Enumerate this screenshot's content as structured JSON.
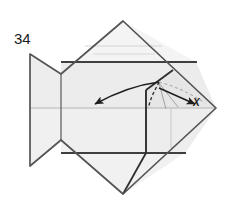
{
  "figure": {
    "kind": "origami-folding-diagram",
    "step_number": "34",
    "point_labels": [
      {
        "id": "x",
        "text": "X",
        "x": 196,
        "y": 105
      }
    ],
    "colors": {
      "paper_front": "#f2f2f2",
      "paper_shade": "#e8e8e8",
      "paper_highlight": "#fafafa",
      "edge_dark": "#3a3a3a",
      "crease_light": "#b5b5b5",
      "crease_mid": "#8a8a8a",
      "guide_gray": "#b0b0b0",
      "arrow_dark": "#1f1f1f",
      "background": "#ffffff",
      "text": "#1a1a1a"
    },
    "outline": {
      "name": "fish-body-diamond",
      "points": "123,21 216,108 123,194 61,140 30,166 30,54 61,74"
    },
    "shapes": [
      {
        "name": "upper-triangle-panel",
        "points": "123,21 196,62 61,62 61,74",
        "fill": "#f4f4f4"
      },
      {
        "name": "upper-mid-band",
        "points": "61,62 196,62 216,108 61,108",
        "fill": "#ececec"
      },
      {
        "name": "lower-mid-band",
        "points": "61,108 216,108 185,153 61,153",
        "fill": "#efefef"
      },
      {
        "name": "lower-triangle-panel",
        "points": "61,153 185,153 123,194 61,140",
        "fill": "#f1f1f1"
      },
      {
        "name": "tail-upper-panel",
        "points": "30,54 61,74 61,108 30,108",
        "fill": "#ededed"
      },
      {
        "name": "tail-lower-panel",
        "points": "30,108 61,108 61,140 30,166",
        "fill": "#f0f0f0"
      },
      {
        "name": "head-flap-panel",
        "points": "146,90 172,71 216,108 146,108",
        "fill": "#e6e6e6"
      },
      {
        "name": "head-lower-panel",
        "points": "146,108 216,108 185,153 146,153",
        "fill": "#ededed"
      }
    ],
    "creases": [
      {
        "name": "crease-center-horizontal",
        "x1": 30,
        "y1": 108,
        "x2": 216,
        "y2": 108,
        "style": "light"
      },
      {
        "name": "crease-upper-horizontal",
        "x1": 61,
        "y1": 62,
        "x2": 196,
        "y2": 62,
        "style": "dark"
      },
      {
        "name": "crease-lower-horizontal",
        "x1": 61,
        "y1": 153,
        "x2": 185,
        "y2": 153,
        "style": "dark"
      },
      {
        "name": "crease-upper-inner-1",
        "x1": 85,
        "y1": 46,
        "x2": 162,
        "y2": 46,
        "style": "faint"
      },
      {
        "name": "crease-upper-inner-2",
        "x1": 93,
        "y1": 54,
        "x2": 155,
        "y2": 54,
        "style": "faint"
      },
      {
        "name": "crease-tail-joint",
        "x1": 61,
        "y1": 74,
        "x2": 61,
        "y2": 140,
        "style": "mid"
      },
      {
        "name": "crease-head-vertical",
        "x1": 146,
        "y1": 90,
        "x2": 146,
        "y2": 153,
        "style": "dark"
      },
      {
        "name": "crease-head-inner-vertical",
        "x1": 171,
        "y1": 108,
        "x2": 171,
        "y2": 148,
        "style": "faint"
      },
      {
        "name": "crease-head-diagonal-upper",
        "x1": 146,
        "y1": 90,
        "x2": 172,
        "y2": 71,
        "style": "dark"
      },
      {
        "name": "crease-head-diagonal-lower",
        "x1": 146,
        "y1": 153,
        "x2": 185,
        "y2": 153,
        "style": "dark"
      },
      {
        "name": "crease-head-bottom-slant",
        "x1": 146,
        "y1": 153,
        "x2": 123,
        "y2": 194,
        "style": "dark"
      }
    ],
    "fold_lines": [
      {
        "name": "mountain-fold-dashed",
        "path": "M 159,82 L 152,96 L 148,108",
        "style": "dashed-dark"
      }
    ],
    "guides": [
      {
        "name": "guide-arc-gray-dashed",
        "path": "M 159,82 Q 182,88 205,103",
        "style": "dashed-gray"
      },
      {
        "name": "guide-line-thin-1",
        "path": "M 159,83 L 166,109",
        "style": "thin-gray"
      },
      {
        "name": "guide-line-thin-2",
        "path": "M 159,83 L 178,107",
        "style": "thin-gray"
      }
    ],
    "arrows": [
      {
        "name": "fold-arrow-left",
        "path": "M 159,82 Q 128,86 93,105",
        "head_at": {
          "x": 91,
          "y": 107
        },
        "head_angle": 152,
        "style": "solid-dark"
      },
      {
        "name": "fold-arrow-right",
        "path": "M 159,88 L 196,105",
        "head_at": {
          "x": 199,
          "y": 106
        },
        "head_angle": 24,
        "style": "solid-dark"
      }
    ]
  }
}
